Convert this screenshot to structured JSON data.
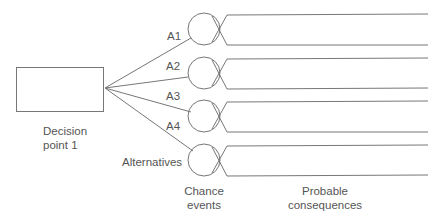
{
  "diagram": {
    "type": "decision-tree",
    "decision_node": {
      "label_line1": "Decision",
      "label_line2": "point 1"
    },
    "alternatives": [
      {
        "label": "A1"
      },
      {
        "label": "A2"
      },
      {
        "label": "A3"
      },
      {
        "label": "A4"
      }
    ],
    "alternatives_label": "Alternatives",
    "chance_label_line1": "Chance",
    "chance_label_line2": "events",
    "consequences_label_line1": "Probable",
    "consequences_label_line2": "consequences",
    "colors": {
      "stroke": "#777777",
      "text": "#555555",
      "background": "#ffffff"
    }
  }
}
